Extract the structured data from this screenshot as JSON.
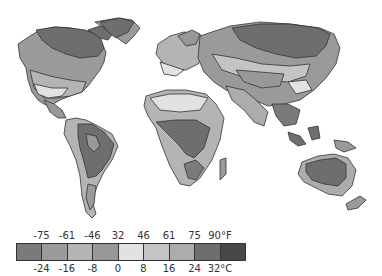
{
  "map": {
    "title": "World annual temperature zones",
    "regions": [
      {
        "name": "north-america",
        "shades": [
          "#6e6e6e",
          "#8c8c8c",
          "#a4a4a4",
          "#c8c8c8",
          "#8c8c8c"
        ]
      },
      {
        "name": "greenland",
        "shades": [
          "#6e6e6e"
        ]
      },
      {
        "name": "south-america",
        "shades": [
          "#6e6e6e",
          "#a4a4a4",
          "#c8c8c8"
        ]
      },
      {
        "name": "europe",
        "shades": [
          "#a4a4a4",
          "#c8c8c8"
        ]
      },
      {
        "name": "africa",
        "shades": [
          "#6e6e6e",
          "#a4a4a4",
          "#c8c8c8"
        ]
      },
      {
        "name": "asia",
        "shades": [
          "#6e6e6e",
          "#8c8c8c",
          "#a4a4a4",
          "#c8c8c8",
          "#e4e4e4"
        ]
      },
      {
        "name": "australia",
        "shades": [
          "#6e6e6e",
          "#a4a4a4"
        ]
      },
      {
        "name": "new-zealand",
        "shades": [
          "#a4a4a4"
        ]
      }
    ]
  },
  "legend": {
    "fahrenheit_labels": [
      "-75",
      "-61",
      "-46",
      "32",
      "46",
      "61",
      "75",
      "90°F"
    ],
    "celsius_labels": [
      "-24",
      "-16",
      "-8",
      "0",
      "8",
      "16",
      "24",
      "32°C"
    ],
    "swatches": [
      "#7a7a7a",
      "#9a9a9a",
      "#b4b4b4",
      "#989898",
      "#e2e2e2",
      "#c4c4c4",
      "#acacac",
      "#6e6e6e",
      "#484848"
    ]
  }
}
